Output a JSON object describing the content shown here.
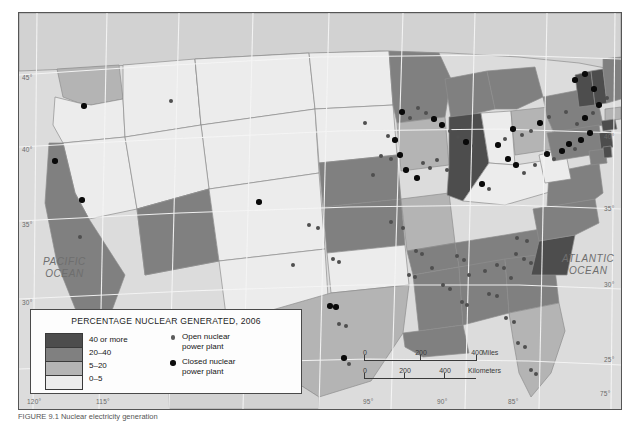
{
  "map": {
    "title_caption": "FIGURE 9.1  Nuclear electricity generation",
    "ocean_labels": [
      {
        "name": "pacific-ocean-label",
        "line1": "PACIFIC",
        "line2": "OCEAN",
        "x": 24,
        "y": 243
      },
      {
        "name": "atlantic-ocean-label",
        "line1": "ATLANTIC",
        "line2": "OCEAN",
        "x": 543,
        "y": 240
      }
    ],
    "graticule": {
      "lat_left": [
        {
          "label": "45°",
          "x": 22,
          "y": 74
        },
        {
          "label": "40°",
          "x": 22,
          "y": 146
        },
        {
          "label": "35°",
          "x": 22,
          "y": 221
        },
        {
          "label": "30°",
          "x": 22,
          "y": 299
        }
      ],
      "lat_right": [
        {
          "label": "40°",
          "x": 604,
          "y": 133
        },
        {
          "label": "35°",
          "x": 604,
          "y": 205
        },
        {
          "label": "30°",
          "x": 604,
          "y": 281
        },
        {
          "label": "25°",
          "x": 604,
          "y": 356
        }
      ],
      "lon_bottom": [
        {
          "label": "120°",
          "x": 27,
          "y": 398
        },
        {
          "label": "115°",
          "x": 96,
          "y": 398
        },
        {
          "label": "95°",
          "x": 363,
          "y": 398
        },
        {
          "label": "90°",
          "x": 437,
          "y": 398
        },
        {
          "label": "85°",
          "x": 508,
          "y": 398
        }
      ],
      "lon_top": [
        {
          "label": "75°",
          "x": 600,
          "y": 390
        }
      ]
    }
  },
  "legend": {
    "title": "PERCENTAGE NUCLEAR GENERATED, 2006",
    "classes": [
      {
        "label": "40 or more",
        "color": "#4d4d4d"
      },
      {
        "label": "20–40",
        "color": "#808080"
      },
      {
        "label": "5–20",
        "color": "#b4b4b4"
      },
      {
        "label": "0–5",
        "color": "#ececec"
      }
    ],
    "plant_keys": [
      {
        "type": "open",
        "line1": "Open nuclear",
        "line2": "power plant"
      },
      {
        "type": "closed",
        "line1": "Closed nuclear",
        "line2": "power plant"
      }
    ]
  },
  "scalebar": {
    "miles": {
      "ticks": [
        "0",
        "200",
        "400"
      ],
      "unit": "Miles"
    },
    "kilometers": {
      "ticks": [
        "0",
        "200",
        "400"
      ],
      "unit": "Kilometers"
    }
  },
  "chart_data": {
    "type": "map",
    "title": "PERCENTAGE NUCLEAR GENERATED, 2006",
    "measure": "Percentage of state electricity generated by nuclear power, 2006",
    "class_breaks": [
      "40 or more",
      "20-40",
      "5-20",
      "0-5"
    ],
    "class_colors": [
      "#4d4d4d",
      "#808080",
      "#b4b4b4",
      "#ececec"
    ],
    "states": [
      {
        "code": "WA",
        "class": "5-20"
      },
      {
        "code": "OR",
        "class": "0-5"
      },
      {
        "code": "CA",
        "class": "20-40"
      },
      {
        "code": "NV",
        "class": "0-5"
      },
      {
        "code": "ID",
        "class": "0-5"
      },
      {
        "code": "MT",
        "class": "0-5"
      },
      {
        "code": "WY",
        "class": "0-5"
      },
      {
        "code": "UT",
        "class": "0-5"
      },
      {
        "code": "AZ",
        "class": "20-40"
      },
      {
        "code": "NM",
        "class": "0-5"
      },
      {
        "code": "CO",
        "class": "0-5"
      },
      {
        "code": "ND",
        "class": "0-5"
      },
      {
        "code": "SD",
        "class": "0-5"
      },
      {
        "code": "NE",
        "class": "20-40"
      },
      {
        "code": "KS",
        "class": "20-40"
      },
      {
        "code": "OK",
        "class": "0-5"
      },
      {
        "code": "TX",
        "class": "5-20"
      },
      {
        "code": "MN",
        "class": "20-40"
      },
      {
        "code": "IA",
        "class": "5-20"
      },
      {
        "code": "MO",
        "class": "5-20"
      },
      {
        "code": "AR",
        "class": "20-40"
      },
      {
        "code": "LA",
        "class": "20-40"
      },
      {
        "code": "WI",
        "class": "20-40"
      },
      {
        "code": "IL",
        "class": "40 or more"
      },
      {
        "code": "MI",
        "class": "20-40"
      },
      {
        "code": "IN",
        "class": "0-5"
      },
      {
        "code": "OH",
        "class": "5-20"
      },
      {
        "code": "KY",
        "class": "0-5"
      },
      {
        "code": "TN",
        "class": "20-40"
      },
      {
        "code": "MS",
        "class": "20-40"
      },
      {
        "code": "AL",
        "class": "20-40"
      },
      {
        "code": "GA",
        "class": "20-40"
      },
      {
        "code": "FL",
        "class": "5-20"
      },
      {
        "code": "SC",
        "class": "40 or more"
      },
      {
        "code": "NC",
        "class": "20-40"
      },
      {
        "code": "VA",
        "class": "20-40"
      },
      {
        "code": "WV",
        "class": "0-5"
      },
      {
        "code": "PA",
        "class": "20-40"
      },
      {
        "code": "NY",
        "class": "20-40"
      },
      {
        "code": "VT",
        "class": "40 or more"
      },
      {
        "code": "NH",
        "class": "40 or more"
      },
      {
        "code": "ME",
        "class": "20-40"
      },
      {
        "code": "MA",
        "class": "5-20"
      },
      {
        "code": "CT",
        "class": "40 or more"
      },
      {
        "code": "RI",
        "class": "0-5"
      },
      {
        "code": "NJ",
        "class": "40 or more"
      },
      {
        "code": "DE",
        "class": "40 or more"
      },
      {
        "code": "MD",
        "class": "20-40"
      }
    ],
    "plants": [
      {
        "type": "closed",
        "x": 65,
        "y": 93
      },
      {
        "type": "open",
        "x": 152,
        "y": 88
      },
      {
        "type": "closed",
        "x": 36,
        "y": 148
      },
      {
        "type": "closed",
        "x": 63,
        "y": 187
      },
      {
        "type": "open",
        "x": 61,
        "y": 224
      },
      {
        "type": "closed",
        "x": 240,
        "y": 189
      },
      {
        "type": "open",
        "x": 290,
        "y": 212
      },
      {
        "type": "open",
        "x": 299,
        "y": 215
      },
      {
        "type": "open",
        "x": 274,
        "y": 252
      },
      {
        "type": "open",
        "x": 314,
        "y": 246
      },
      {
        "type": "open",
        "x": 320,
        "y": 249
      },
      {
        "type": "closed",
        "x": 311,
        "y": 293
      },
      {
        "type": "closed",
        "x": 317,
        "y": 294
      },
      {
        "type": "open",
        "x": 320,
        "y": 311
      },
      {
        "type": "open",
        "x": 327,
        "y": 313
      },
      {
        "type": "open",
        "x": 330,
        "y": 351
      },
      {
        "type": "closed",
        "x": 325,
        "y": 345
      },
      {
        "type": "open",
        "x": 346,
        "y": 110
      },
      {
        "type": "open",
        "x": 369,
        "y": 123
      },
      {
        "type": "closed",
        "x": 376,
        "y": 127
      },
      {
        "type": "open",
        "x": 362,
        "y": 143
      },
      {
        "type": "open",
        "x": 372,
        "y": 146
      },
      {
        "type": "closed",
        "x": 381,
        "y": 142
      },
      {
        "type": "open",
        "x": 354,
        "y": 162
      },
      {
        "type": "closed",
        "x": 387,
        "y": 157
      },
      {
        "type": "closed",
        "x": 398,
        "y": 165
      },
      {
        "type": "open",
        "x": 404,
        "y": 150
      },
      {
        "type": "open",
        "x": 411,
        "y": 155
      },
      {
        "type": "open",
        "x": 418,
        "y": 147
      },
      {
        "type": "open",
        "x": 428,
        "y": 157
      },
      {
        "type": "open",
        "x": 372,
        "y": 209
      },
      {
        "type": "open",
        "x": 384,
        "y": 215
      },
      {
        "type": "open",
        "x": 397,
        "y": 238
      },
      {
        "type": "open",
        "x": 403,
        "y": 241
      },
      {
        "type": "open",
        "x": 390,
        "y": 262
      },
      {
        "type": "open",
        "x": 396,
        "y": 264
      },
      {
        "type": "open",
        "x": 413,
        "y": 255
      },
      {
        "type": "open",
        "x": 424,
        "y": 272
      },
      {
        "type": "open",
        "x": 431,
        "y": 276
      },
      {
        "type": "open",
        "x": 438,
        "y": 243
      },
      {
        "type": "open",
        "x": 445,
        "y": 247
      },
      {
        "type": "open",
        "x": 450,
        "y": 262
      },
      {
        "type": "open",
        "x": 443,
        "y": 289
      },
      {
        "type": "open",
        "x": 448,
        "y": 292
      },
      {
        "type": "open",
        "x": 466,
        "y": 258
      },
      {
        "type": "open",
        "x": 478,
        "y": 252
      },
      {
        "type": "open",
        "x": 485,
        "y": 255
      },
      {
        "type": "open",
        "x": 492,
        "y": 265
      },
      {
        "type": "open",
        "x": 470,
        "y": 281
      },
      {
        "type": "open",
        "x": 478,
        "y": 283
      },
      {
        "type": "open",
        "x": 497,
        "y": 241
      },
      {
        "type": "open",
        "x": 505,
        "y": 246
      },
      {
        "type": "open",
        "x": 512,
        "y": 250
      },
      {
        "type": "open",
        "x": 498,
        "y": 225
      },
      {
        "type": "open",
        "x": 508,
        "y": 228
      },
      {
        "type": "open",
        "x": 487,
        "y": 305
      },
      {
        "type": "open",
        "x": 495,
        "y": 309
      },
      {
        "type": "open",
        "x": 499,
        "y": 330
      },
      {
        "type": "open",
        "x": 506,
        "y": 334
      },
      {
        "type": "open",
        "x": 512,
        "y": 357
      },
      {
        "type": "open",
        "x": 517,
        "y": 361
      },
      {
        "type": "closed",
        "x": 463,
        "y": 171
      },
      {
        "type": "open",
        "x": 470,
        "y": 176
      },
      {
        "type": "closed",
        "x": 489,
        "y": 146
      },
      {
        "type": "closed",
        "x": 497,
        "y": 152
      },
      {
        "type": "open",
        "x": 505,
        "y": 160
      },
      {
        "type": "open",
        "x": 516,
        "y": 152
      },
      {
        "type": "closed",
        "x": 528,
        "y": 141
      },
      {
        "type": "open",
        "x": 535,
        "y": 146
      },
      {
        "type": "closed",
        "x": 543,
        "y": 138
      },
      {
        "type": "closed",
        "x": 550,
        "y": 131
      },
      {
        "type": "open",
        "x": 556,
        "y": 136
      },
      {
        "type": "closed",
        "x": 562,
        "y": 127
      },
      {
        "type": "closed",
        "x": 571,
        "y": 120
      },
      {
        "type": "open",
        "x": 558,
        "y": 111
      },
      {
        "type": "closed",
        "x": 566,
        "y": 105
      },
      {
        "type": "open",
        "x": 574,
        "y": 100
      },
      {
        "type": "closed",
        "x": 580,
        "y": 92
      },
      {
        "type": "open",
        "x": 588,
        "y": 85
      },
      {
        "type": "closed",
        "x": 575,
        "y": 76
      },
      {
        "type": "open",
        "x": 547,
        "y": 99
      },
      {
        "type": "open",
        "x": 530,
        "y": 104
      },
      {
        "type": "closed",
        "x": 521,
        "y": 110
      },
      {
        "type": "open",
        "x": 512,
        "y": 118
      },
      {
        "type": "open",
        "x": 503,
        "y": 122
      },
      {
        "type": "closed",
        "x": 494,
        "y": 116
      },
      {
        "type": "open",
        "x": 486,
        "y": 126
      },
      {
        "type": "closed",
        "x": 479,
        "y": 132
      },
      {
        "type": "open",
        "x": 455,
        "y": 133
      },
      {
        "type": "closed",
        "x": 447,
        "y": 129
      },
      {
        "type": "open",
        "x": 439,
        "y": 124
      },
      {
        "type": "open",
        "x": 431,
        "y": 118
      },
      {
        "type": "closed",
        "x": 423,
        "y": 112
      },
      {
        "type": "closed",
        "x": 415,
        "y": 106
      },
      {
        "type": "open",
        "x": 407,
        "y": 100
      },
      {
        "type": "open",
        "x": 399,
        "y": 95
      },
      {
        "type": "open",
        "x": 391,
        "y": 105
      },
      {
        "type": "closed",
        "x": 383,
        "y": 99
      },
      {
        "type": "closed",
        "x": 556,
        "y": 67
      },
      {
        "type": "closed",
        "x": 566,
        "y": 61
      }
    ]
  }
}
